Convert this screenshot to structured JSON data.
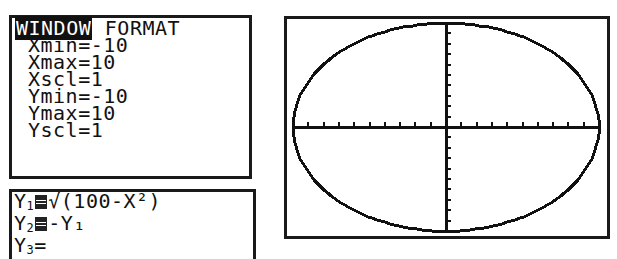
{
  "window_screen": {
    "tabs": [
      {
        "label": "WINDOW",
        "active": true
      },
      {
        "label": "FORMAT",
        "active": false
      }
    ],
    "settings": [
      {
        "name": "Xmin",
        "value": "-10"
      },
      {
        "name": "Xmax",
        "value": "10"
      },
      {
        "name": "Xscl",
        "value": "1"
      },
      {
        "name": "Ymin",
        "value": "-10"
      },
      {
        "name": "Ymax",
        "value": "10"
      },
      {
        "name": "Yscl",
        "value": "1"
      }
    ]
  },
  "y_editor": {
    "functions": [
      {
        "name": "Y",
        "sub": "1",
        "selected": true,
        "expr": "√(100-X²)"
      },
      {
        "name": "Y",
        "sub": "2",
        "selected": true,
        "expr": "-Y₁"
      },
      {
        "name": "Y",
        "sub": "3",
        "selected": false,
        "expr": ""
      }
    ]
  },
  "graph": {
    "xmin": -10,
    "xmax": 10,
    "ymin": -10,
    "ymax": 10,
    "xscl": 1,
    "yscl": 1,
    "curve": "circle x²+y²=100 (appears as ellipse on non-square window)"
  }
}
